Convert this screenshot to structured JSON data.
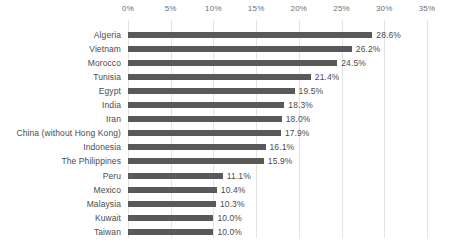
{
  "chart_data": {
    "type": "bar",
    "orientation": "horizontal",
    "title": "",
    "subtitle": "",
    "xlabel": "",
    "ylabel": "",
    "xlim": [
      0,
      35
    ],
    "grid": true,
    "legend": false,
    "legend_position": "none",
    "value_suffix": "%",
    "bar_color": "#595959",
    "gridline_color": "#e3e3e3",
    "tick_label_color": "#6d6e71",
    "label_color": "#4b4b4d",
    "xticks": [
      0,
      5,
      10,
      15,
      20,
      25,
      30,
      35
    ],
    "xticklabels": [
      "0%",
      "5%",
      "10%",
      "15%",
      "20%",
      "25%",
      "30%",
      "35%"
    ],
    "categories": [
      "Algeria",
      "Vietnam",
      "Morocco",
      "Tunisia",
      "Egypt",
      "India",
      "Iran",
      "China (without Hong Kong)",
      "Indonesia",
      "The Philippines",
      "Peru",
      "Mexico",
      "Malaysia",
      "Kuwait",
      "Taiwan"
    ],
    "values": [
      28.6,
      26.2,
      24.5,
      21.4,
      19.5,
      18.3,
      18.0,
      17.9,
      16.1,
      15.9,
      11.1,
      10.4,
      10.3,
      10.0,
      10.0
    ],
    "data_labels": [
      "28.6%",
      "26.2%",
      "24.5%",
      "21.4%",
      "19.5%",
      "18.3%",
      "18.0%",
      "17.9%",
      "16.1%",
      "15.9%",
      "11.1%",
      "10.4%",
      "10.3%",
      "10.0%",
      "10.0%"
    ]
  }
}
